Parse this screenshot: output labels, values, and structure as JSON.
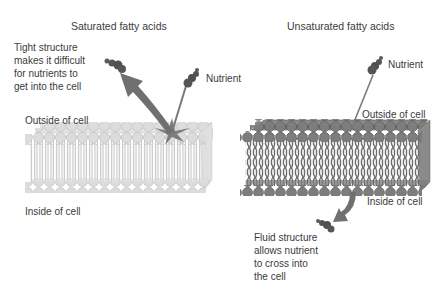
{
  "left_panel": {
    "title": "Saturated fatty acids",
    "annotation": "Tight structure\nmakes it difficult\nfor nutrients to\nget into the cell",
    "nutrient_label": "Nutrient",
    "outside_label": "Outside of cell",
    "inside_label": "Inside of cell",
    "membrane_color": "#d9d9d9",
    "membrane_stroke": "#bdbdbd"
  },
  "right_panel": {
    "title": "Unsaturated fatty acids",
    "annotation": "Fluid structure\nallows nutrient\nto cross into\nthe cell",
    "nutrient_label": "Nutrient",
    "outside_label": "Outside of cell",
    "inside_label": "Inside of cell",
    "membrane_color": "#7a7a7a",
    "membrane_stroke": "#5a5a5a"
  },
  "colors": {
    "arrow": "#707070",
    "nutrient": "#555555"
  }
}
